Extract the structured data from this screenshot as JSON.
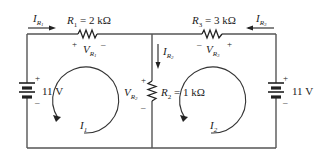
{
  "diagram": {
    "type": "two-loop DC circuit",
    "components": {
      "R1": {
        "name": "R",
        "sub": "1",
        "value": "= 2 kΩ"
      },
      "R2": {
        "name": "R",
        "sub": "2",
        "value": "= 1 kΩ"
      },
      "R3": {
        "name": "R",
        "sub": "3",
        "value": "= 3 kΩ"
      },
      "E1": {
        "value": "11 V"
      },
      "E2": {
        "value": "11 V"
      }
    },
    "currents": {
      "IR1": {
        "name": "I",
        "sub": "R",
        "subsub": "1"
      },
      "IR2": {
        "name": "I",
        "sub": "R",
        "subsub": "2"
      },
      "IR3": {
        "name": "I",
        "sub": "R",
        "subsub": "3"
      }
    },
    "voltages": {
      "VR1": {
        "name": "V",
        "sub": "R",
        "subsub": "1"
      },
      "VR2": {
        "name": "V",
        "sub": "R",
        "subsub": "2"
      },
      "VR3": {
        "name": "V",
        "sub": "R",
        "subsub": "3"
      }
    },
    "loops": {
      "I1": {
        "name": "I",
        "sub": "1"
      },
      "I2": {
        "name": "I",
        "sub": "2"
      }
    },
    "signs": {
      "plus": "+",
      "minus": "–"
    }
  }
}
